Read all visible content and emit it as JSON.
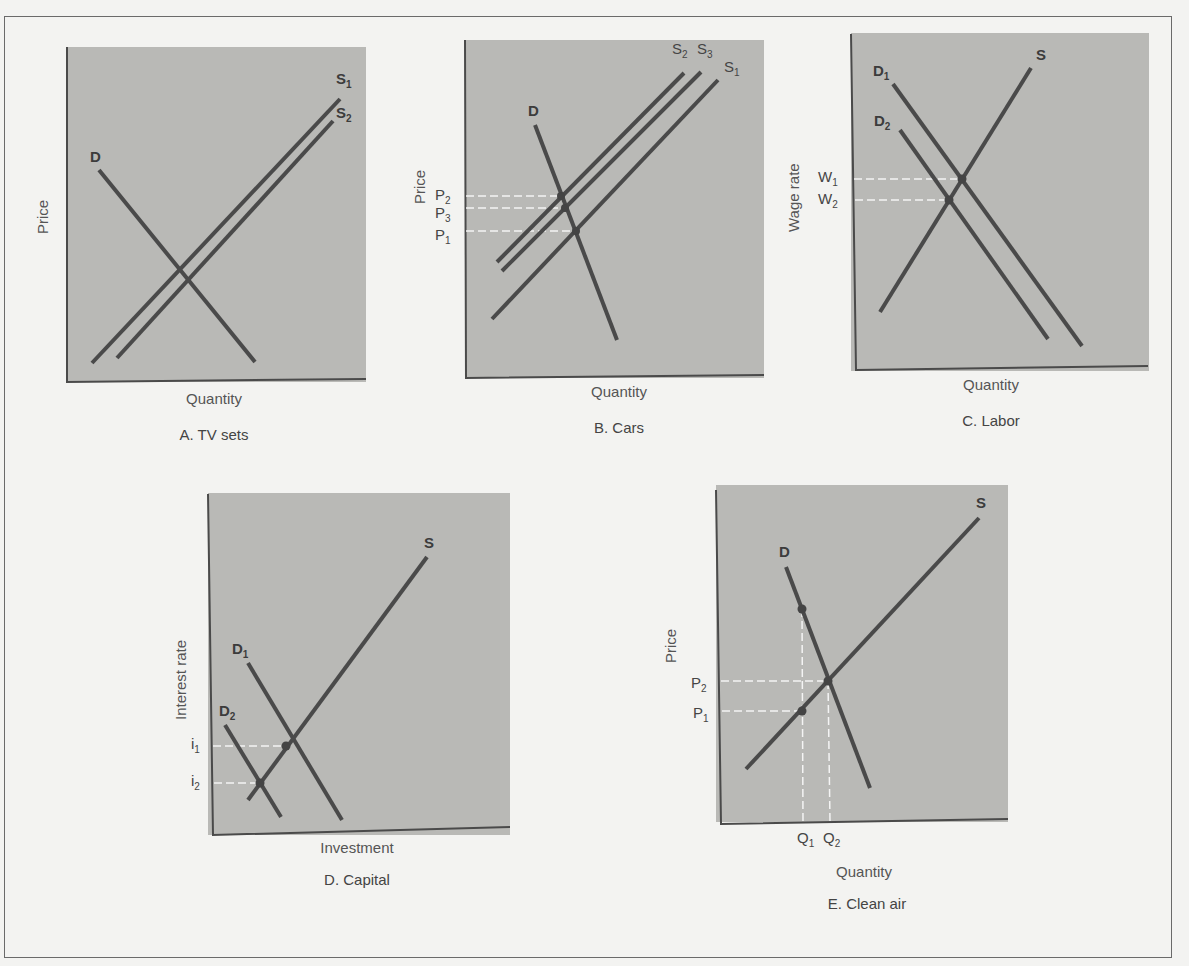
{
  "figure": {
    "panels": [
      {
        "id": "A",
        "caption": "A.  TV sets",
        "xlabel": "Quantity",
        "ylabel": "Price",
        "curves": [
          {
            "name": "D",
            "label": "D",
            "sub": ""
          },
          {
            "name": "S1",
            "label": "S",
            "sub": "1"
          },
          {
            "name": "S2",
            "label": "S",
            "sub": "2"
          }
        ]
      },
      {
        "id": "B",
        "caption": "B.  Cars",
        "xlabel": "Quantity",
        "ylabel": "Price",
        "curves": [
          {
            "name": "D",
            "label": "D",
            "sub": ""
          },
          {
            "name": "S2",
            "label": "S",
            "sub": "2"
          },
          {
            "name": "S3",
            "label": "S",
            "sub": "3"
          },
          {
            "name": "S1",
            "label": "S",
            "sub": "1"
          }
        ],
        "price_levels": [
          {
            "label": "P",
            "sub": "2"
          },
          {
            "label": "P",
            "sub": "3"
          },
          {
            "label": "P",
            "sub": "1"
          }
        ]
      },
      {
        "id": "C",
        "caption": "C.  Labor",
        "xlabel": "Quantity",
        "ylabel": "Wage rate",
        "curves": [
          {
            "name": "D1",
            "label": "D",
            "sub": "1"
          },
          {
            "name": "D2",
            "label": "D",
            "sub": "2"
          },
          {
            "name": "S",
            "label": "S",
            "sub": ""
          }
        ],
        "price_levels": [
          {
            "label": "W",
            "sub": "1"
          },
          {
            "label": "W",
            "sub": "2"
          }
        ]
      },
      {
        "id": "D",
        "caption": "D.  Capital",
        "xlabel": "Investment",
        "ylabel": "Interest rate",
        "curves": [
          {
            "name": "S",
            "label": "S",
            "sub": ""
          },
          {
            "name": "D1",
            "label": "D",
            "sub": "1"
          },
          {
            "name": "D2",
            "label": "D",
            "sub": "2"
          }
        ],
        "price_levels": [
          {
            "label": "i",
            "sub": "1"
          },
          {
            "label": "i",
            "sub": "2"
          }
        ]
      },
      {
        "id": "E",
        "caption": "E.  Clean air",
        "xlabel": "Quantity",
        "ylabel": "Price",
        "curves": [
          {
            "name": "D",
            "label": "D",
            "sub": ""
          },
          {
            "name": "S",
            "label": "S",
            "sub": ""
          }
        ],
        "price_levels": [
          {
            "label": "P",
            "sub": "2"
          },
          {
            "label": "P",
            "sub": "1"
          }
        ],
        "quantity_levels": [
          {
            "label": "Q",
            "sub": "1"
          },
          {
            "label": "Q",
            "sub": "2"
          }
        ]
      }
    ],
    "colors": {
      "page": "#f3f3f1",
      "plot_fill": "#b9b9b6",
      "line": "#4a4a4a",
      "guide": "#f4f4f4"
    }
  }
}
